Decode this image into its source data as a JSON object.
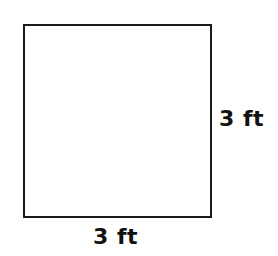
{
  "diagram": {
    "shape": "square",
    "side_labels": {
      "right": "3 ft",
      "bottom": "3 ft"
    },
    "colors": {
      "stroke": "#1a1a1a",
      "text": "#111111",
      "background": "#ffffff"
    }
  }
}
